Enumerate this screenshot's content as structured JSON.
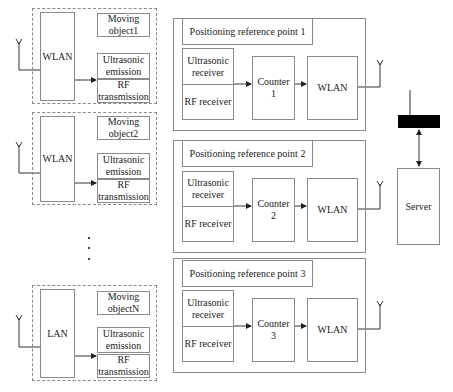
{
  "moving_objects": [
    {
      "label": "Moving object1",
      "label_l1": "Moving",
      "label_l2": "object1",
      "network": "WLAN",
      "ultrasonic_l1": "Ultrasonic",
      "ultrasonic_l2": "emission",
      "rf_l1": "RF",
      "rf_l2": "transmission"
    },
    {
      "label": "Moving object2",
      "label_l1": "Moving",
      "label_l2": "object2",
      "network": "WLAN",
      "ultrasonic_l1": "Ultrasonic",
      "ultrasonic_l2": "emission",
      "rf_l1": "RF",
      "rf_l2": "transmission"
    },
    {
      "label": "Moving objectN",
      "label_l1": "Moving",
      "label_l2": "objectN",
      "network": "LAN",
      "ultrasonic_l1": "Ultrasonic",
      "ultrasonic_l2": "emission",
      "rf_l1": "RF",
      "rf_l2": "transmission"
    }
  ],
  "ellipsis": "· · ·",
  "reference_points": [
    {
      "title": "Positioning reference point 1",
      "ultrasonic_l1": "Ultrasonic",
      "ultrasonic_l2": "receiver",
      "rf": "RF receiver",
      "counter_l1": "Counter",
      "counter_l2": "1",
      "network": "WLAN"
    },
    {
      "title": "Positioning reference point 2",
      "ultrasonic_l1": "Ultrasonic",
      "ultrasonic_l2": "receiver",
      "rf": "RF receiver",
      "counter_l1": "Counter",
      "counter_l2": "2",
      "network": "WLAN"
    },
    {
      "title": "Positioning reference point 3",
      "ultrasonic_l1": "Ultrasonic",
      "ultrasonic_l2": "receiver",
      "rf": "RF receiver",
      "counter_l1": "Counter",
      "counter_l2": "3",
      "network": "WLAN"
    }
  ],
  "server": {
    "label": "Server"
  },
  "colors": {
    "line": "#333333",
    "border": "#8a8a8a",
    "bar": "#000000"
  }
}
